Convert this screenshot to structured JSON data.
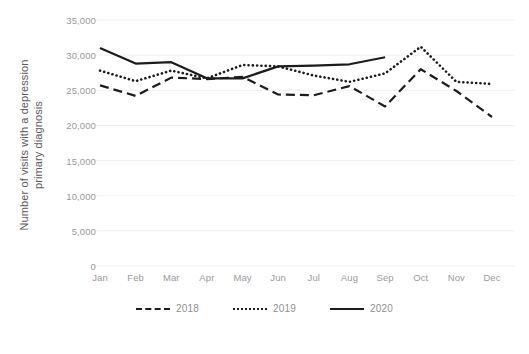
{
  "chart_data": {
    "type": "line",
    "title": "",
    "xlabel": "",
    "ylabel": "Number of visits with a depression primary diagnosis",
    "ylabel_line1": "Number of visits with a depression",
    "ylabel_line2": "primary diagnosis",
    "categories": [
      "Jan",
      "Feb",
      "Mar",
      "Apr",
      "May",
      "Jun",
      "Jul",
      "Aug",
      "Sep",
      "Oct",
      "Nov",
      "Dec"
    ],
    "ylim": [
      0,
      35000
    ],
    "ytick_labels": [
      "35,000",
      "30,000",
      "25,000",
      "20,000",
      "15,000",
      "10,000",
      "5,000",
      "0"
    ],
    "ytick_values": [
      35000,
      30000,
      25000,
      20000,
      15000,
      10000,
      5000,
      0
    ],
    "grid": true,
    "legend_position": "bottom",
    "series": [
      {
        "name": "2018",
        "style": "dashed",
        "color": "#1c1c1c",
        "values": [
          25700,
          24200,
          26800,
          26600,
          26900,
          24400,
          24300,
          25600,
          22700,
          28000,
          24900,
          21200
        ]
      },
      {
        "name": "2019",
        "style": "dotted",
        "color": "#1c1c1c",
        "values": [
          27800,
          26300,
          27800,
          26700,
          28600,
          28400,
          27100,
          26200,
          27400,
          31200,
          26200,
          25900
        ]
      },
      {
        "name": "2020",
        "style": "solid",
        "color": "#1c1c1c",
        "values": [
          31000,
          28800,
          29000,
          26700,
          26700,
          28400,
          28500,
          28700,
          29700,
          null,
          null,
          null
        ]
      }
    ]
  },
  "legend": {
    "items": [
      {
        "label": "2018",
        "style": "dashed"
      },
      {
        "label": "2019",
        "style": "dotted"
      },
      {
        "label": "2020",
        "style": "solid"
      }
    ]
  },
  "colors": {
    "line": "#1c1c1c",
    "grid": "#efefef",
    "tick_text": "#9a9a9a",
    "axis_title": "#5a5a5a",
    "background": "#ffffff"
  }
}
